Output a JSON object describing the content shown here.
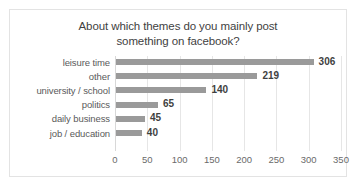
{
  "chart_data": {
    "type": "bar",
    "orientation": "horizontal",
    "title": "About which themes do you mainly post something on facebook?",
    "title_lines": [
      "About which themes do you mainly post",
      "something on facebook?"
    ],
    "categories": [
      "leisure time",
      "other",
      "university / school",
      "politics",
      "daily business",
      "job / education"
    ],
    "values": [
      306,
      219,
      140,
      65,
      45,
      40
    ],
    "value_labels": [
      "306",
      "219",
      "140",
      "65",
      "45",
      "40"
    ],
    "xlabel": "",
    "ylabel": "",
    "xlim": [
      0,
      350
    ],
    "xticks": [
      0,
      50,
      100,
      150,
      200,
      250,
      300,
      350
    ],
    "xtick_labels": [
      "0",
      "50",
      "100",
      "150",
      "200",
      "250",
      "300",
      "350"
    ],
    "grid": true,
    "grid_axis": "x",
    "legend": false,
    "series": [
      {
        "name": "responses",
        "values": [
          306,
          219,
          140,
          65,
          45,
          40
        ]
      }
    ],
    "colors": {
      "bar": "#9a9a9a",
      "grid": "#e6e6e6",
      "border": "#e3e3e3",
      "title_text": "#3f3f3f",
      "category_text": "#5a5a5a",
      "tick_text": "#6a6a6a",
      "value_text": "#3f3f3f",
      "background": "#ffffff"
    }
  }
}
